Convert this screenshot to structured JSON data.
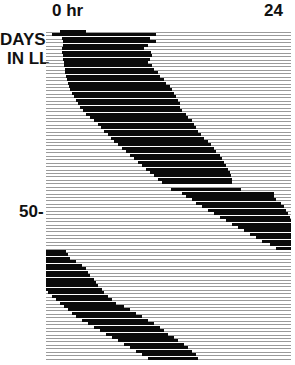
{
  "labels": {
    "x_start": "0 hr",
    "x_end": "24",
    "y_title_line1": "DAYS",
    "y_title_line2": "IN LL",
    "y_tick_50": "50-"
  },
  "chart_data": {
    "type": "actogram",
    "title": "",
    "xlabel": "Time of day (hr)",
    "ylabel": "DAYS IN LL",
    "x_range": [
      0,
      24
    ],
    "x_tick_labels": [
      "0 hr",
      "24"
    ],
    "y_tick_labels": [
      "50"
    ],
    "day_count": 96,
    "activity_bands_hr": [
      {
        "days": [
          1,
          3
        ],
        "onset": 1.5,
        "offset": 11.0,
        "note": "sparse"
      },
      {
        "days": [
          4,
          20
        ],
        "onset_start": 1.4,
        "onset_end": 3.4,
        "offset_start": 10.3,
        "offset_end": 13.4
      },
      {
        "days": [
          21,
          45
        ],
        "onset_start": 3.6,
        "onset_end": 12.0,
        "offset_start": 13.6,
        "offset_end": 17.0
      },
      {
        "days": [
          47,
          63
        ],
        "onset_start": 14.0,
        "onset_end": 23.0,
        "offset_start": 22.0,
        "offset_end": 24.0
      },
      {
        "days": [
          64,
          76
        ],
        "onset_start": 0.0,
        "onset_end": 0.2,
        "offset_start": 2.0,
        "offset_end": 5.2
      },
      {
        "days": [
          77,
          96
        ],
        "onset_start": 0.8,
        "onset_end": 10.3,
        "offset_start": 6.0,
        "offset_end": 15.5
      }
    ],
    "rows": [
      [
        14,
        40
      ],
      [
        6,
        110
      ],
      [
        16,
        104
      ],
      [
        17,
        110
      ],
      [
        17,
        102
      ],
      [
        16,
        98
      ],
      [
        16,
        105
      ],
      [
        17,
        106
      ],
      [
        17,
        104
      ],
      [
        18,
        102
      ],
      [
        18,
        106
      ],
      [
        19,
        108
      ],
      [
        19,
        112
      ],
      [
        20,
        114
      ],
      [
        21,
        118
      ],
      [
        22,
        120
      ],
      [
        23,
        124
      ],
      [
        24,
        126
      ],
      [
        26,
        128
      ],
      [
        28,
        130
      ],
      [
        30,
        132
      ],
      [
        32,
        134
      ],
      [
        34,
        134
      ],
      [
        37,
        136
      ],
      [
        40,
        140
      ],
      [
        44,
        142
      ],
      [
        48,
        146
      ],
      [
        52,
        148
      ],
      [
        55,
        150
      ],
      [
        58,
        152
      ],
      [
        62,
        155
      ],
      [
        65,
        158
      ],
      [
        68,
        162
      ],
      [
        72,
        165
      ],
      [
        76,
        168
      ],
      [
        80,
        170
      ],
      [
        84,
        174
      ],
      [
        88,
        176
      ],
      [
        92,
        178
      ],
      [
        96,
        180
      ],
      [
        100,
        182
      ],
      [
        104,
        184
      ],
      [
        108,
        185
      ],
      [
        112,
        186
      ],
      [
        116,
        186
      ],
      [
        0,
        0
      ],
      [
        125,
        195
      ],
      [
        136,
        228
      ],
      [
        140,
        228
      ],
      [
        146,
        230
      ],
      [
        150,
        235
      ],
      [
        156,
        238
      ],
      [
        162,
        240
      ],
      [
        168,
        242
      ],
      [
        174,
        244
      ],
      [
        180,
        245
      ],
      [
        186,
        245
      ],
      [
        192,
        245
      ],
      [
        198,
        245
      ],
      [
        204,
        245
      ],
      [
        210,
        245
      ],
      [
        216,
        245
      ],
      [
        224,
        245
      ],
      [
        230,
        245
      ],
      [
        0,
        20
      ],
      [
        0,
        22
      ],
      [
        0,
        24
      ],
      [
        0,
        30
      ],
      [
        0,
        36
      ],
      [
        0,
        40
      ],
      [
        0,
        42
      ],
      [
        0,
        44
      ],
      [
        0,
        48
      ],
      [
        0,
        50
      ],
      [
        0,
        52
      ],
      [
        0,
        56
      ],
      [
        2,
        58
      ],
      [
        6,
        62
      ],
      [
        10,
        66
      ],
      [
        14,
        70
      ],
      [
        18,
        78
      ],
      [
        22,
        84
      ],
      [
        26,
        90
      ],
      [
        30,
        96
      ],
      [
        36,
        102
      ],
      [
        42,
        108
      ],
      [
        48,
        114
      ],
      [
        54,
        118
      ],
      [
        60,
        122
      ],
      [
        66,
        128
      ],
      [
        72,
        132
      ],
      [
        78,
        138
      ],
      [
        84,
        142
      ],
      [
        90,
        146
      ],
      [
        96,
        150
      ],
      [
        102,
        152
      ]
    ]
  }
}
